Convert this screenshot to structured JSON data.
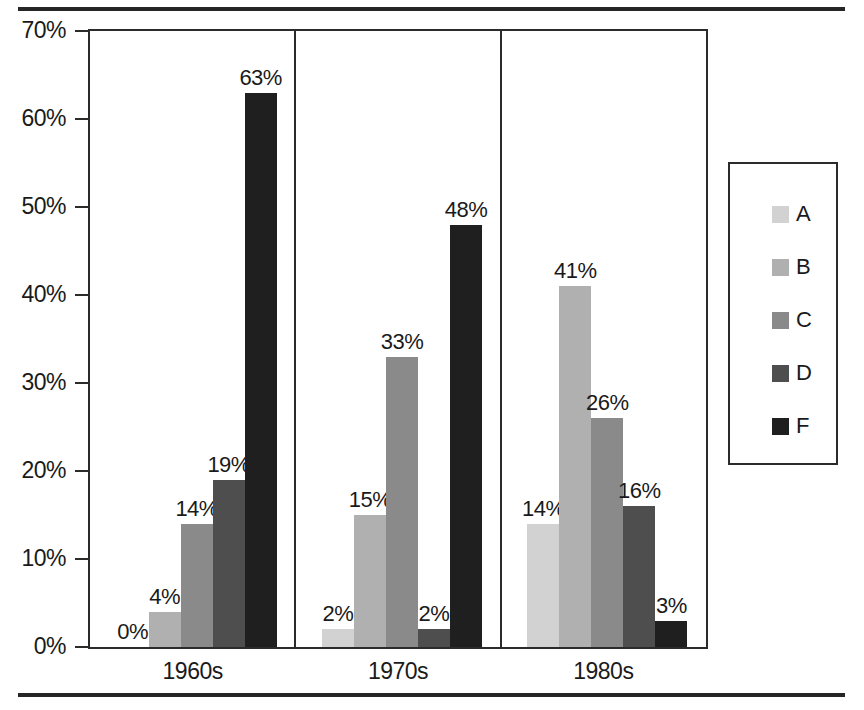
{
  "chart_data": {
    "type": "bar",
    "title": "",
    "subtitle": "",
    "xlabel": "",
    "ylabel": "",
    "categories": [
      "1960s",
      "1970s",
      "1980s"
    ],
    "series": [
      {
        "name": "A",
        "color": "#d2d2d2",
        "values": [
          0,
          2,
          14
        ],
        "labels": [
          "0%",
          "2%",
          "14%"
        ]
      },
      {
        "name": "B",
        "color": "#b0b0b0",
        "values": [
          4,
          15,
          41
        ],
        "labels": [
          "4%",
          "15%",
          "41%"
        ]
      },
      {
        "name": "C",
        "color": "#8a8a8a",
        "values": [
          14,
          33,
          26
        ],
        "labels": [
          "14%",
          "33%",
          "26%"
        ]
      },
      {
        "name": "D",
        "color": "#4e4e4e",
        "values": [
          19,
          2,
          16
        ],
        "labels": [
          "19%",
          "2%",
          "16%"
        ]
      },
      {
        "name": "F",
        "color": "#1f1f1f",
        "values": [
          63,
          48,
          3
        ],
        "labels": [
          "63%",
          "48%",
          "3%"
        ]
      }
    ],
    "ylim": [
      0,
      70
    ],
    "ytick_values": [
      0,
      10,
      20,
      30,
      40,
      50,
      60,
      70
    ],
    "ytick_labels": [
      "0%",
      "10%",
      "20%",
      "30%",
      "40%",
      "50%",
      "60%",
      "70%"
    ],
    "grid": false,
    "legend_position": "right",
    "legend_entries": [
      "A",
      "B",
      "C",
      "D",
      "F"
    ],
    "value_labels_shown": true,
    "panel_separators": true
  },
  "axis": {
    "y": {
      "ticks": [
        {
          "label": "70%",
          "value": 70
        },
        {
          "label": "60%",
          "value": 60
        },
        {
          "label": "50%",
          "value": 50
        },
        {
          "label": "40%",
          "value": 40
        },
        {
          "label": "30%",
          "value": 30
        },
        {
          "label": "20%",
          "value": 20
        },
        {
          "label": "10%",
          "value": 10
        },
        {
          "label": "0%",
          "value": 0
        }
      ]
    },
    "x": {
      "labels": [
        "1960s",
        "1970s",
        "1980s"
      ]
    }
  },
  "legend": {
    "items": [
      {
        "label": "A",
        "color": "#d2d2d2"
      },
      {
        "label": "B",
        "color": "#b0b0b0"
      },
      {
        "label": "C",
        "color": "#8a8a8a"
      },
      {
        "label": "D",
        "color": "#4e4e4e"
      },
      {
        "label": "F",
        "color": "#1f1f1f"
      }
    ]
  },
  "style": {
    "frame_color": "#2b2b2b",
    "rule_color": "#262626",
    "background": "#ffffff",
    "text_color": "#1a1a1a"
  }
}
